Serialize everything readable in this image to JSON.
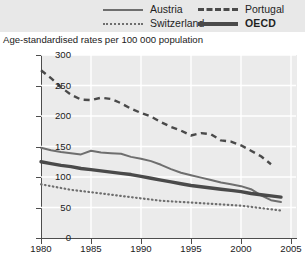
{
  "legend": {
    "items": [
      {
        "label": "Austria",
        "style": "solid",
        "color": "#6e6e6e"
      },
      {
        "label": "Switzerland",
        "style": "dotted",
        "color": "#6e6e6e"
      },
      {
        "label": "Portugal",
        "style": "dashed",
        "color": "#4a4a4a"
      },
      {
        "label": "OECD",
        "style": "thick",
        "color": "#4a4a4a"
      }
    ]
  },
  "axis_title": "Age-standardised rates per 100 000 population",
  "chart_data": {
    "type": "line",
    "title": "",
    "subtitle": "",
    "xlabel": "",
    "ylabel": "Age-standardised rates per 100 000 population",
    "xlim": [
      1980,
      2005.5
    ],
    "ylim": [
      0,
      300
    ],
    "yticks": [
      0,
      50,
      100,
      150,
      200,
      250,
      300
    ],
    "xticks": [
      1980,
      1985,
      1990,
      1995,
      2000,
      2005
    ],
    "grid": true,
    "grid_color": "#ffffff",
    "plot_background": "#ebebeb",
    "legend_position": "top",
    "series": [
      {
        "name": "Austria",
        "style": "solid",
        "color": "#6e6e6e",
        "x": [
          1980,
          1981,
          1982,
          1983,
          1984,
          1985,
          1986,
          1987,
          1988,
          1989,
          1990,
          1991,
          1992,
          1993,
          1994,
          1995,
          1996,
          1997,
          1998,
          1999,
          2000,
          2001,
          2002,
          2003,
          2004
        ],
        "values": [
          148,
          144,
          141,
          139,
          137,
          143,
          140,
          139,
          138,
          133,
          130,
          126,
          120,
          113,
          107,
          103,
          99,
          95,
          91,
          88,
          85,
          80,
          70,
          62,
          59
        ]
      },
      {
        "name": "Switzerland",
        "style": "dotted",
        "color": "#6e6e6e",
        "x": [
          1980,
          1981,
          1982,
          1983,
          1984,
          1985,
          1986,
          1987,
          1988,
          1989,
          1990,
          1991,
          1992,
          1993,
          1994,
          1995,
          1996,
          1997,
          1998,
          1999,
          2000,
          2001,
          2002,
          2003,
          2004
        ],
        "values": [
          88,
          85,
          82,
          79,
          77,
          75,
          73,
          71,
          69,
          67,
          65,
          63,
          61,
          60,
          59,
          58,
          57,
          56,
          55,
          54,
          53,
          51,
          49,
          47,
          45
        ]
      },
      {
        "name": "Portugal",
        "style": "dashed",
        "color": "#4a4a4a",
        "x": [
          1980,
          1981,
          1982,
          1983,
          1984,
          1985,
          1986,
          1987,
          1988,
          1989,
          1990,
          1991,
          1992,
          1993,
          1994,
          1995,
          1996,
          1997,
          1998,
          1999,
          2000,
          2001,
          2002,
          2003
        ],
        "values": [
          275,
          262,
          247,
          235,
          227,
          226,
          230,
          228,
          221,
          212,
          205,
          199,
          190,
          182,
          176,
          168,
          172,
          170,
          160,
          158,
          152,
          143,
          134,
          121
        ]
      },
      {
        "name": "OECD",
        "style": "thick",
        "color": "#4a4a4a",
        "x": [
          1980,
          1981,
          1982,
          1983,
          1984,
          1985,
          1986,
          1987,
          1988,
          1989,
          1990,
          1991,
          1992,
          1993,
          1994,
          1995,
          1996,
          1997,
          1998,
          1999,
          2000,
          2001,
          2002,
          2003,
          2004
        ],
        "values": [
          125,
          122,
          119,
          117,
          114,
          112,
          110,
          108,
          106,
          104,
          101,
          98,
          95,
          92,
          89,
          86,
          84,
          82,
          80,
          78,
          76,
          73,
          71,
          69,
          67
        ]
      }
    ]
  }
}
